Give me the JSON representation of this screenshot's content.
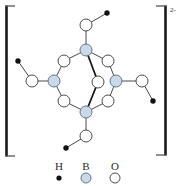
{
  "figure": {
    "charge": "2-",
    "colors": {
      "hydrogen": "#111111",
      "boron": "#c9d9ea",
      "oxygen": "#ffffff",
      "bond": "#4a4a4a"
    },
    "atoms": [
      {
        "id": "B1",
        "element": "B",
        "x": 86,
        "y": 50
      },
      {
        "id": "B2",
        "element": "B",
        "x": 54,
        "y": 81
      },
      {
        "id": "B3",
        "element": "B",
        "x": 116,
        "y": 81
      },
      {
        "id": "B4",
        "element": "B",
        "x": 86,
        "y": 112
      },
      {
        "id": "O1",
        "element": "O",
        "x": 86,
        "y": 25
      },
      {
        "id": "O2",
        "element": "O",
        "x": 32,
        "y": 81
      },
      {
        "id": "O3",
        "element": "O",
        "x": 142,
        "y": 81
      },
      {
        "id": "O4",
        "element": "O",
        "x": 86,
        "y": 136
      },
      {
        "id": "O5",
        "element": "O",
        "x": 64,
        "y": 61
      },
      {
        "id": "O6",
        "element": "O",
        "x": 64,
        "y": 101
      },
      {
        "id": "O7",
        "element": "O",
        "x": 108,
        "y": 61
      },
      {
        "id": "O8",
        "element": "O",
        "x": 108,
        "y": 101
      },
      {
        "id": "O9",
        "element": "O",
        "x": 98,
        "y": 82
      },
      {
        "id": "H1",
        "element": "H",
        "x": 107,
        "y": 13
      },
      {
        "id": "H2",
        "element": "H",
        "x": 18,
        "y": 61
      },
      {
        "id": "H3",
        "element": "H",
        "x": 153,
        "y": 101
      },
      {
        "id": "H4",
        "element": "H",
        "x": 66,
        "y": 148
      }
    ],
    "bonds": [
      [
        "B1",
        "O1"
      ],
      [
        "O1",
        "H1"
      ],
      [
        "B2",
        "O2"
      ],
      [
        "O2",
        "H2"
      ],
      [
        "B3",
        "O3"
      ],
      [
        "O3",
        "H3"
      ],
      [
        "B4",
        "O4"
      ],
      [
        "O4",
        "H4"
      ],
      [
        "B1",
        "O5"
      ],
      [
        "O5",
        "B2"
      ],
      [
        "B2",
        "O6"
      ],
      [
        "O6",
        "B4"
      ],
      [
        "B1",
        "O7"
      ],
      [
        "O7",
        "B3"
      ],
      [
        "B3",
        "O8"
      ],
      [
        "O8",
        "B4"
      ],
      [
        "B1",
        "O9",
        "bold"
      ],
      [
        "O9",
        "B4",
        "bold"
      ]
    ],
    "legend": [
      {
        "label": "H",
        "element": "H"
      },
      {
        "label": "B",
        "element": "B"
      },
      {
        "label": "O",
        "element": "O"
      }
    ]
  }
}
